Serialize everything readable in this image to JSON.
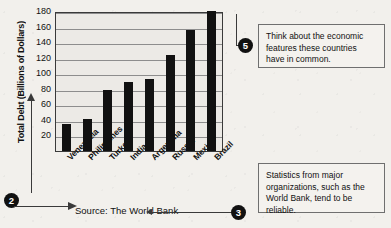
{
  "chart_data": {
    "type": "bar",
    "title": "",
    "xlabel": "",
    "ylabel": "Total Debt (Billions of Dollars)",
    "categories": [
      "Venezuela",
      "Philippines",
      "Turkey",
      "India",
      "Argentina",
      "Russia",
      "Mexico",
      "Brazil"
    ],
    "values": [
      35,
      41,
      79,
      89,
      93,
      124,
      155,
      180
    ],
    "ylim": [
      0,
      180
    ],
    "yticks": [
      20,
      40,
      60,
      80,
      100,
      120,
      140,
      160,
      180
    ],
    "grid": true,
    "legend": false,
    "bar_color": "#111111",
    "plot_background": "#eceae6"
  },
  "source": {
    "text": "Source: The World Bank"
  },
  "markers": {
    "two": "2",
    "three": "3",
    "five": "5"
  },
  "callouts": {
    "top": "Think about the economic features these countries have in common.",
    "bottom": "Statistics from major organizations, such as the World Bank, tend to be reliable."
  },
  "colors": {
    "page_background": "#f2f0ec",
    "ink": "#111111",
    "rule": "#3a3a3a",
    "gridline": "#8d8d8d"
  }
}
